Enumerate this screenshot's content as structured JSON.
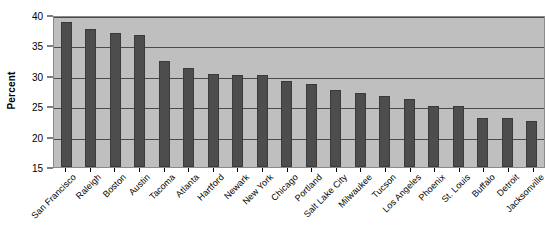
{
  "chart_data": {
    "type": "bar",
    "title": "",
    "xlabel": "",
    "ylabel": "Percent",
    "ylim": [
      15,
      40
    ],
    "yticks": [
      15,
      20,
      25,
      30,
      35,
      40
    ],
    "grid": true,
    "legend": false,
    "orientation": "vertical",
    "categories": [
      "San Francisco",
      "Raleigh",
      "Boston",
      "Austin",
      "Tacoma",
      "Atlanta",
      "Hartford",
      "Newark",
      "New York",
      "Chicago",
      "Portland",
      "Salt Lake City",
      "Milwaukee",
      "Tucson",
      "Los Angeles",
      "Phoenix",
      "St. Louis",
      "Buffalo",
      "Detroit",
      "Jacksonville"
    ],
    "values": [
      38.9,
      37.7,
      37.0,
      36.7,
      32.4,
      31.3,
      30.3,
      30.2,
      30.2,
      29.1,
      28.7,
      27.6,
      27.1,
      26.7,
      26.2,
      25.0,
      25.0,
      23.1,
      23.1,
      22.5
    ],
    "colors": {
      "bar_fill": "#4d4d4d",
      "bar_edge": "#3a3a3a",
      "plot_background": "#bfbfbf",
      "gridline": "#4a4a4a",
      "axis": "#000000",
      "figure_background": "#ffffff"
    }
  }
}
